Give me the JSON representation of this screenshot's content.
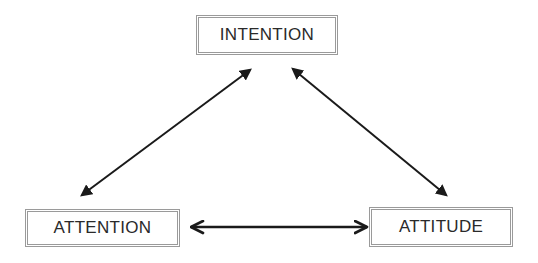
{
  "diagram": {
    "nodes": [
      {
        "id": "intention",
        "label": "INTENTION"
      },
      {
        "id": "attention",
        "label": "ATTENTION"
      },
      {
        "id": "attitude",
        "label": "ATTITUDE"
      }
    ],
    "edges": [
      {
        "from": "attention",
        "to": "intention",
        "direction": "bidirectional",
        "head_style": "filled"
      },
      {
        "from": "intention",
        "to": "attitude",
        "direction": "bidirectional",
        "head_style": "filled"
      },
      {
        "from": "attention",
        "to": "attitude",
        "direction": "bidirectional",
        "head_style": "open"
      }
    ],
    "colors": {
      "box_border": "#9a9a9a",
      "text": "#2a2a2a",
      "arrow": "#1a1a1a"
    }
  }
}
